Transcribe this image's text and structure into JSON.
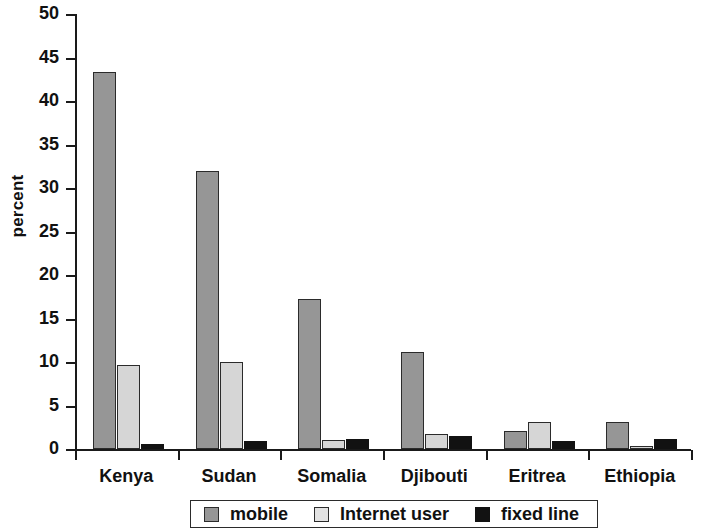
{
  "chart_data": {
    "type": "bar",
    "title": "",
    "xlabel": "",
    "ylabel": "percent",
    "ylim": [
      0,
      50
    ],
    "yticks": [
      0,
      5,
      10,
      15,
      20,
      25,
      30,
      35,
      40,
      45,
      50
    ],
    "ytick_labels": [
      "0",
      "5",
      "10",
      "15",
      "20",
      "25",
      "30",
      "35",
      "40",
      "45",
      "50"
    ],
    "grid": false,
    "legend_position": "bottom",
    "categories": [
      "Kenya",
      "Sudan",
      "Somalia",
      "Djibouti",
      "Eritrea",
      "Ethiopia"
    ],
    "series": [
      {
        "name": "mobile",
        "color": "#969696",
        "values": [
          43.3,
          32.0,
          17.2,
          11.1,
          2.1,
          3.1
        ]
      },
      {
        "name": "Internet user",
        "color": "#d6d6d6",
        "values": [
          9.6,
          10.0,
          1.0,
          1.7,
          3.1,
          0.4
        ]
      },
      {
        "name": "fixed line",
        "color": "#121212",
        "values": [
          0.6,
          0.9,
          1.2,
          1.5,
          0.9,
          1.1
        ]
      }
    ]
  },
  "legend": {
    "items": [
      {
        "label": "mobile",
        "swatch": "mobile"
      },
      {
        "label": "Internet user",
        "swatch": "internet"
      },
      {
        "label": "fixed line",
        "swatch": "fixed"
      }
    ]
  },
  "colors": {
    "mobile": "#969696",
    "internet_user": "#d6d6d6",
    "fixed_line": "#121212",
    "axis": "#1a1a1a",
    "background": "#ffffff"
  }
}
